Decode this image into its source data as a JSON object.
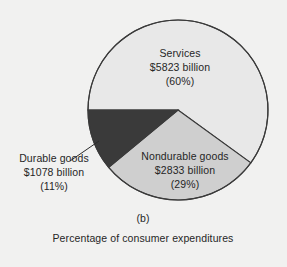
{
  "figure": {
    "panel_label": "(b)",
    "caption": "Percentage of consumer expenditures",
    "background_color": "#f1f1f0",
    "outline_color": "#3a3a3a"
  },
  "chart_data": {
    "type": "pie",
    "title": "Percentage of consumer expenditures",
    "subtitle": "(b)",
    "unit": "billions of dollars",
    "categories": [
      "Services",
      "Nondurable goods",
      "Durable goods"
    ],
    "values": [
      5823,
      2833,
      1078
    ],
    "percentages": [
      60,
      29,
      11
    ],
    "colors": [
      "#e8e8e8",
      "#cfcfcf",
      "#3a3a3a"
    ],
    "legend": "none",
    "labels_inside": [
      true,
      true,
      false
    ],
    "slices": [
      {
        "name": "Services",
        "name_text": "Services",
        "value_text": "$5823 billion",
        "percent_text": "(60%)",
        "value": 5823,
        "percent": 60,
        "color": "#e8e8e8"
      },
      {
        "name": "Nondurable goods",
        "name_text": "Nondurable goods",
        "value_text": "$2833 billion",
        "percent_text": "(29%)",
        "value": 2833,
        "percent": 29,
        "color": "#cfcfcf"
      },
      {
        "name": "Durable goods",
        "name_text": "Durable goods",
        "value_text": "$1078 billion",
        "percent_text": "(11%)",
        "value": 1078,
        "percent": 11,
        "color": "#3a3a3a"
      }
    ]
  }
}
